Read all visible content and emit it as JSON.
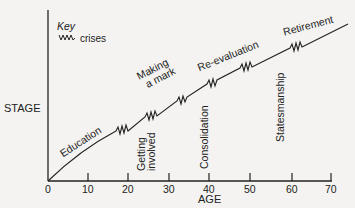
{
  "diagram": {
    "y_axis_label": "STAGE",
    "x_axis_label": "AGE",
    "x_ticks": [
      "0",
      "10",
      "20",
      "30",
      "40",
      "50",
      "60",
      "70"
    ],
    "key": {
      "title": "Key",
      "crises_label": "crises",
      "crises_icon": "zigzag-icon"
    },
    "stages_along_curve": [
      {
        "label": "Education"
      },
      {
        "label_line1": "Making",
        "label_line2": "a mark"
      },
      {
        "label": "Re-evaluation"
      },
      {
        "label": "Retirement"
      }
    ],
    "stages_vertical": [
      {
        "label_line1": "Getting",
        "label_line2": "involved"
      },
      {
        "label": "Consolidation"
      },
      {
        "label": "Statesmanship"
      }
    ],
    "line_color": "#222222",
    "background_color": "#f4f3f1"
  }
}
